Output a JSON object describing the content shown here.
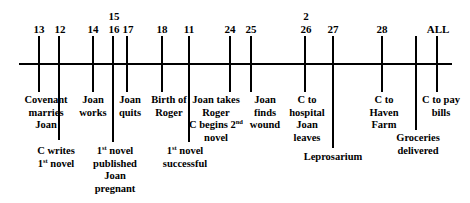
{
  "diagram": {
    "type": "timeline",
    "axis": {
      "x1": 19,
      "x2": 452,
      "y": 64
    },
    "markers": [
      {
        "id": "m13",
        "x": 39,
        "chapter": "13",
        "extra": "",
        "bottom": 92
      },
      {
        "id": "m12",
        "x": 59,
        "chapter": "12",
        "extra": "",
        "bottom": 140
      },
      {
        "id": "m14",
        "x": 93,
        "chapter": "14",
        "extra": "",
        "bottom": 92
      },
      {
        "id": "m16",
        "x": 113,
        "chapter": "16",
        "extra": "15",
        "bottom": 142
      },
      {
        "id": "m17",
        "x": 127,
        "chapter": "17",
        "extra": "",
        "bottom": 92
      },
      {
        "id": "m18",
        "x": 162,
        "chapter": "18",
        "extra": "",
        "bottom": 92
      },
      {
        "id": "m11",
        "x": 189,
        "chapter": "11",
        "extra": "",
        "bottom": 142
      },
      {
        "id": "m24",
        "x": 230,
        "chapter": "24",
        "extra": "",
        "bottom": 92
      },
      {
        "id": "m25",
        "x": 251,
        "chapter": "25",
        "extra": "",
        "bottom": 92
      },
      {
        "id": "m26",
        "x": 305,
        "chapter": "26",
        "extra": "2",
        "bottom": 92
      },
      {
        "id": "m27",
        "x": 333,
        "chapter": "27",
        "extra": "",
        "bottom": 148
      },
      {
        "id": "m28",
        "x": 382,
        "chapter": "28",
        "extra": "",
        "bottom": 92
      },
      {
        "id": "mblank",
        "x": 416,
        "chapter": "",
        "extra": "",
        "bottom": 130
      },
      {
        "id": "mall",
        "x": 437,
        "chapter": "ALL",
        "extra": "",
        "bottom": 92
      }
    ],
    "labels": {
      "covenant_marries_joan": [
        "Covenant",
        "marries",
        "Joan"
      ],
      "c_writes_first_novel": [
        "C writes",
        "1|st| novel"
      ],
      "joan_works": [
        "Joan",
        "works"
      ],
      "first_novel_published": [
        "1|st| novel",
        "published",
        "Joan",
        "pregnant"
      ],
      "joan_quits": [
        "Joan",
        "quits"
      ],
      "birth_of_roger": [
        "Birth of",
        "Roger"
      ],
      "first_novel_successful": [
        "1|st| novel",
        "successful"
      ],
      "joan_takes_roger": [
        "Joan takes",
        "Roger",
        "C begins 2|nd|",
        "novel"
      ],
      "joan_finds_wound": [
        "Joan",
        "finds",
        "wound"
      ],
      "c_to_hospital": [
        "C to",
        "hospital",
        "Joan",
        "leaves"
      ],
      "leprosarium": [
        "Leprosarium"
      ],
      "c_to_haven_farm": [
        "C to",
        "Haven",
        "Farm"
      ],
      "groceries_delivered": [
        "Groceries",
        "delivered"
      ],
      "c_to_pay_bills": [
        "C to pay",
        "bills"
      ]
    }
  },
  "text": {
    "n13": "13",
    "n12": "12",
    "n14": "14",
    "n15": "15",
    "n16": "16",
    "n17": "17",
    "n18": "18",
    "n11": "11",
    "n24": "24",
    "n25": "25",
    "n2": "2",
    "n26": "26",
    "n27": "27",
    "n28": "28",
    "nall": "ALL",
    "covenant": "Covenant",
    "marries": "marries",
    "joan": "Joan",
    "c_writes": "C writes",
    "one": "1",
    "st": "st",
    "nd": "nd",
    "novel": " novel",
    "works": "works",
    "published": "published",
    "pregnant": "pregnant",
    "quits": "quits",
    "birth_of": "Birth of",
    "roger": "Roger",
    "successful": "successful",
    "joan_takes": "Joan takes",
    "c_begins_2": "C begins 2",
    "novel_word": "novel",
    "finds": "finds",
    "wound": "wound",
    "c_to": "C to",
    "hospital": "hospital",
    "leaves": "leaves",
    "leprosarium": "Leprosarium",
    "haven": "Haven",
    "farm": "Farm",
    "groceries": "Groceries",
    "delivered": "delivered",
    "c_to_pay": "C to pay",
    "bills": "bills"
  }
}
